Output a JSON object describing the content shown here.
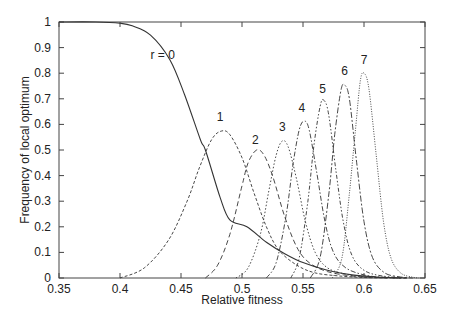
{
  "chart_data": {
    "type": "line",
    "title": "",
    "xlabel": "Relative fitness",
    "ylabel": "Frequency of local optimum",
    "xlim": [
      0.35,
      0.65
    ],
    "ylim": [
      0,
      1
    ],
    "xticks": [
      "0.35",
      "0.4",
      "0.45",
      "0.5",
      "0.55",
      "0.6",
      "0.65"
    ],
    "yticks": [
      "0",
      "0.1",
      "0.2",
      "0.3",
      "0.4",
      "0.5",
      "0.6",
      "0.7",
      "0.8",
      "0.9",
      "1"
    ],
    "grid": false,
    "legend": "none (curves labeled inline)",
    "series": [
      {
        "name": "r = 0",
        "label": "r = 0",
        "label_pos": [
          0.435,
          0.87
        ],
        "style": "solid",
        "x": [
          0.35,
          0.38,
          0.4,
          0.41,
          0.425,
          0.441,
          0.453,
          0.466,
          0.47,
          0.482,
          0.49,
          0.504,
          0.52,
          0.535,
          0.55,
          0.57,
          0.59,
          0.61,
          0.63
        ],
        "y": [
          1.0,
          1.0,
          0.995,
          0.985,
          0.949,
          0.852,
          0.715,
          0.539,
          0.5,
          0.316,
          0.227,
          0.2,
          0.14,
          0.095,
          0.06,
          0.03,
          0.012,
          0.004,
          0.0
        ]
      },
      {
        "name": "1",
        "label": "1",
        "label_pos": [
          0.482,
          0.63
        ],
        "style": "dash-fine",
        "x": [
          0.4,
          0.42,
          0.44,
          0.455,
          0.465,
          0.475,
          0.483,
          0.49,
          0.5,
          0.51,
          0.52,
          0.53,
          0.545,
          0.56,
          0.58,
          0.6,
          0.62
        ],
        "y": [
          0.0,
          0.04,
          0.15,
          0.3,
          0.43,
          0.54,
          0.574,
          0.56,
          0.47,
          0.33,
          0.2,
          0.11,
          0.05,
          0.02,
          0.008,
          0.002,
          0.0
        ]
      },
      {
        "name": "2",
        "label": "2",
        "label_pos": [
          0.511,
          0.54
        ],
        "style": "dash-long",
        "x": [
          0.47,
          0.48,
          0.49,
          0.5,
          0.505,
          0.512,
          0.518,
          0.525,
          0.535,
          0.545,
          0.555,
          0.57,
          0.59,
          0.61,
          0.63
        ],
        "y": [
          0.0,
          0.05,
          0.17,
          0.36,
          0.45,
          0.5,
          0.48,
          0.4,
          0.24,
          0.12,
          0.06,
          0.025,
          0.008,
          0.002,
          0.0
        ]
      },
      {
        "name": "3",
        "label": "3",
        "label_pos": [
          0.533,
          0.59
        ],
        "style": "dot",
        "x": [
          0.495,
          0.505,
          0.515,
          0.522,
          0.528,
          0.533,
          0.538,
          0.545,
          0.552,
          0.56,
          0.57,
          0.585,
          0.6,
          0.62,
          0.635
        ],
        "y": [
          0.0,
          0.04,
          0.17,
          0.34,
          0.48,
          0.535,
          0.51,
          0.38,
          0.22,
          0.1,
          0.04,
          0.015,
          0.005,
          0.001,
          0.0
        ]
      },
      {
        "name": "4",
        "label": "4",
        "label_pos": [
          0.549,
          0.665
        ],
        "style": "dash-dot",
        "x": [
          0.52,
          0.528,
          0.536,
          0.542,
          0.547,
          0.551,
          0.555,
          0.561,
          0.568,
          0.575,
          0.585,
          0.6,
          0.615,
          0.635
        ],
        "y": [
          0.0,
          0.06,
          0.24,
          0.45,
          0.58,
          0.613,
          0.58,
          0.42,
          0.22,
          0.1,
          0.04,
          0.012,
          0.003,
          0.0
        ]
      },
      {
        "name": "5",
        "label": "5",
        "label_pos": [
          0.566,
          0.74
        ],
        "style": "dash-dot-dot",
        "x": [
          0.54,
          0.547,
          0.554,
          0.559,
          0.564,
          0.567,
          0.571,
          0.577,
          0.583,
          0.59,
          0.6,
          0.615,
          0.635
        ],
        "y": [
          0.0,
          0.08,
          0.3,
          0.52,
          0.67,
          0.695,
          0.64,
          0.42,
          0.22,
          0.09,
          0.03,
          0.008,
          0.0
        ]
      },
      {
        "name": "6",
        "label": "6",
        "label_pos": [
          0.584,
          0.81
        ],
        "style": "dash-mixed",
        "x": [
          0.556,
          0.564,
          0.571,
          0.576,
          0.581,
          0.584,
          0.588,
          0.594,
          0.6,
          0.607,
          0.617,
          0.63,
          0.64
        ],
        "y": [
          0.0,
          0.08,
          0.32,
          0.56,
          0.73,
          0.754,
          0.7,
          0.45,
          0.22,
          0.08,
          0.02,
          0.004,
          0.0
        ]
      },
      {
        "name": "7",
        "label": "7",
        "label_pos": [
          0.6,
          0.85
        ],
        "style": "dot-fine",
        "x": [
          0.574,
          0.582,
          0.588,
          0.593,
          0.597,
          0.6,
          0.604,
          0.61,
          0.616,
          0.622,
          0.63,
          0.64,
          0.645
        ],
        "y": [
          0.0,
          0.08,
          0.33,
          0.58,
          0.77,
          0.8,
          0.74,
          0.48,
          0.22,
          0.08,
          0.02,
          0.003,
          0.0
        ]
      }
    ]
  },
  "colors": {
    "axis": "#444444",
    "curve": "#333333",
    "background": "#ffffff"
  }
}
